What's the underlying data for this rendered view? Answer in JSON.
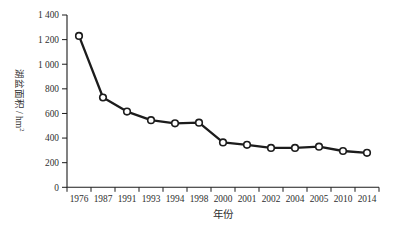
{
  "figure": {
    "background": "#ffffff",
    "ink_color": "#1c1c1c",
    "text_color": "#2e2e2e"
  },
  "chart_data": {
    "type": "line",
    "title": "",
    "xlabel": "年份",
    "ylabel": "湖盆面积 / hm²",
    "ylabel_base": "湖盆面积 / hm",
    "ylabel_sup": "2",
    "categories": [
      "1976",
      "1987",
      "1991",
      "1993",
      "1994",
      "1998",
      "2000",
      "2001",
      "2002",
      "2004",
      "2005",
      "2010",
      "2014"
    ],
    "series": [
      {
        "name": "湖盆面积",
        "values": [
          1230,
          730,
          615,
          545,
          520,
          525,
          365,
          345,
          320,
          320,
          330,
          295,
          280
        ]
      }
    ],
    "ylim": [
      0,
      1400
    ],
    "ytick_interval": 200,
    "ytick_labels": [
      "0",
      "200",
      "400",
      "600",
      "800",
      "1 000",
      "1 200",
      "1 400"
    ],
    "grid": false,
    "legend_position": "none",
    "marker": "open-circle",
    "line_color": "#1c1c1c",
    "marker_fill": "#ffffff"
  }
}
